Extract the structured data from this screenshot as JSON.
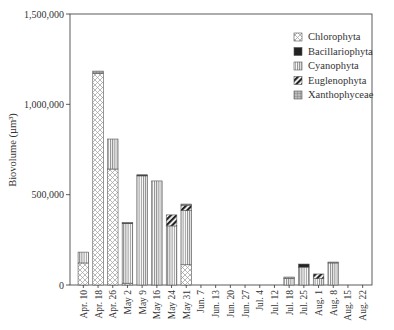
{
  "chart_data": {
    "type": "bar",
    "stacked": true,
    "title": "",
    "xlabel": "",
    "ylabel": "Biovolume (µm³)",
    "ylim": [
      0,
      1500000
    ],
    "yticks": [
      0,
      500000,
      1000000,
      1500000
    ],
    "ytick_labels": [
      "0",
      "500,000",
      "1,000,000",
      "1,500,000"
    ],
    "grid": false,
    "legend_position": "upper right (inside)",
    "categories": [
      "Apr. 10",
      "Apr. 18",
      "Apr. 26",
      "May 2",
      "May 9",
      "May 16",
      "May 24",
      "May 31",
      "Jun. 7",
      "Jun. 13",
      "Jun. 20",
      "Jun. 27",
      "Jul. 4",
      "Jul. 12",
      "Jul. 18",
      "Jul. 25",
      "Aug. 1",
      "Aug. 8",
      "Aug. 15",
      "Aug. 22"
    ],
    "series": [
      {
        "name": "Chlorophyta",
        "pattern": "crosshatch-dots",
        "values": [
          122000,
          1172000,
          642000,
          10000,
          0,
          0,
          0,
          112000,
          0,
          0,
          0,
          0,
          0,
          0,
          0,
          0,
          0,
          0,
          0,
          0
        ]
      },
      {
        "name": "Cyanophyta",
        "pattern": "vertical-lines",
        "values": [
          60000,
          0,
          166000,
          330000,
          604000,
          576000,
          327000,
          300000,
          0,
          0,
          0,
          0,
          0,
          0,
          36000,
          99000,
          35000,
          122000,
          0,
          0
        ]
      },
      {
        "name": "Euglenophyta",
        "pattern": "diagonal-heavy",
        "values": [
          0,
          0,
          0,
          0,
          0,
          0,
          61000,
          30000,
          0,
          0,
          0,
          0,
          0,
          0,
          0,
          0,
          26000,
          0,
          0,
          0
        ]
      },
      {
        "name": "Bacillariophyta",
        "pattern": "solid-dark",
        "values": [
          0,
          0,
          0,
          5000,
          6000,
          0,
          0,
          0,
          0,
          0,
          0,
          0,
          0,
          0,
          0,
          17000,
          0,
          0,
          0,
          0
        ]
      },
      {
        "name": "Xanthophyceae",
        "pattern": "grid-box",
        "values": [
          0,
          12000,
          0,
          0,
          0,
          0,
          0,
          6000,
          0,
          0,
          0,
          0,
          0,
          0,
          8000,
          0,
          0,
          5000,
          0,
          0
        ]
      }
    ],
    "totals_approx": [
      182000,
      1184000,
      808000,
      345000,
      610000,
      576000,
      388000,
      448000,
      0,
      0,
      0,
      0,
      0,
      0,
      44000,
      116000,
      61000,
      127000,
      0,
      0
    ]
  },
  "legend": {
    "items": [
      {
        "label": "Chlorophyta",
        "pattern": "crosshatch-dots"
      },
      {
        "label": "Bacillariophyta",
        "pattern": "solid-dark"
      },
      {
        "label": "Cyanophyta",
        "pattern": "vertical-lines"
      },
      {
        "label": "Euglenophyta",
        "pattern": "diagonal-heavy"
      },
      {
        "label": "Xanthophyceae",
        "pattern": "grid-box"
      }
    ]
  },
  "colors": {
    "axis": "#333333",
    "bar_outline": "#555555",
    "pattern_fill": "#777777",
    "solid_dark": "#222222"
  }
}
